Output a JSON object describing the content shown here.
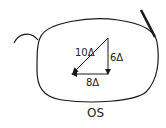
{
  "diagram": {
    "eye_label": "OS",
    "vectors": {
      "resultant": {
        "label": "10Δ",
        "magnitude": 10
      },
      "vertical": {
        "label": "6Δ",
        "magnitude": 6
      },
      "horizontal": {
        "label": "8Δ",
        "magnitude": 8
      }
    },
    "colors": {
      "line": "#1a1a1a",
      "background": "#ffffff"
    }
  }
}
